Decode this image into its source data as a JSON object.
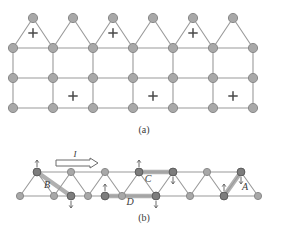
{
  "figure": {
    "type": "triangular-lattice-diagram",
    "background": "#ffffff",
    "panels": [
      {
        "id": "a",
        "caption": "(a)",
        "description": "Two-dimensional triangular lattice with marked plaquettes"
      },
      {
        "id": "b",
        "caption": "(b)",
        "description": "Quasi-one-dimensional triangular ladder with labelled bonds and spin arrows"
      }
    ]
  },
  "colors": {
    "node_fill": "#a8a8a8",
    "node_stroke": "#8a8a8a",
    "node_dark_fill": "#7d7d7d",
    "node_dark_stroke": "#5d5d5d",
    "edge": "#9a9a9a",
    "bond_highlight": "#b0b0b0",
    "marker": "#4a4a4a",
    "label": "#3a3a3a",
    "arrow": "#6a6a6a"
  },
  "panel_a": {
    "caption": "(a)",
    "rows": [
      {
        "name": "row-1",
        "y": 18,
        "x_start": 33,
        "count": 6,
        "spacing": 40
      },
      {
        "name": "row-2",
        "y": 48,
        "x_start": 13,
        "count": 7,
        "spacing": 40
      },
      {
        "name": "row-3",
        "y": 78,
        "x_start": 13,
        "count": 7,
        "spacing": 40
      },
      {
        "name": "row-4",
        "y": 108,
        "x_start": 13,
        "count": 7,
        "spacing": 40
      }
    ],
    "markers": [
      {
        "name": "plus-marker-1",
        "x": 33,
        "y": 33
      },
      {
        "name": "plus-marker-2",
        "x": 113,
        "y": 33
      },
      {
        "name": "plus-marker-3",
        "x": 193,
        "y": 33
      },
      {
        "name": "plus-marker-4",
        "x": 73,
        "y": 96
      },
      {
        "name": "plus-marker-5",
        "x": 153,
        "y": 96
      },
      {
        "name": "plus-marker-6",
        "x": 233,
        "y": 96
      }
    ],
    "marker_symbol": "plus-star"
  },
  "panel_b": {
    "caption": "(b)",
    "current_label": "I",
    "current_arrow": "right-arrow",
    "top_nodes": {
      "y": 172,
      "x_start": 37,
      "count": 7,
      "spacing": 34
    },
    "bottom_nodes": {
      "y": 196,
      "x_start": 20,
      "count": 8,
      "spacing": 34
    },
    "bond_labels": [
      {
        "name": "bond-label-B",
        "text": "B",
        "x": 47,
        "y": 188
      },
      {
        "name": "bond-label-C",
        "text": "C",
        "x": 148,
        "y": 182
      },
      {
        "name": "bond-label-D",
        "text": "D",
        "x": 130,
        "y": 205
      },
      {
        "name": "bond-label-A",
        "text": "A",
        "x": 245,
        "y": 190
      }
    ],
    "spin_arrows": [
      {
        "name": "spin-up-1",
        "x": 37,
        "y": 172,
        "dir": "up"
      },
      {
        "name": "spin-down-1",
        "x": 71,
        "y": 196,
        "dir": "down"
      },
      {
        "name": "spin-up-2",
        "x": 105,
        "y": 196,
        "dir": "up"
      },
      {
        "name": "spin-up-3",
        "x": 139,
        "y": 172,
        "dir": "up"
      },
      {
        "name": "spin-down-2",
        "x": 156,
        "y": 196,
        "dir": "down"
      },
      {
        "name": "spin-down-3",
        "x": 173,
        "y": 172,
        "dir": "down"
      },
      {
        "name": "spin-up-4",
        "x": 224,
        "y": 196,
        "dir": "up"
      },
      {
        "name": "spin-down-4",
        "x": 241,
        "y": 172,
        "dir": "down"
      }
    ],
    "highlighted_bonds": [
      {
        "name": "highlight-bond-B",
        "x1": 37,
        "y1": 172,
        "x2": 71,
        "y2": 196
      },
      {
        "name": "highlight-bond-C",
        "x1": 139,
        "y1": 172,
        "x2": 173,
        "y2": 172
      },
      {
        "name": "highlight-bond-D",
        "x1": 105,
        "y1": 196,
        "x2": 156,
        "y2": 196
      },
      {
        "name": "highlight-bond-A",
        "x1": 224,
        "y1": 196,
        "x2": 241,
        "y2": 172
      }
    ],
    "dark_nodes": [
      {
        "name": "dark-node-1",
        "x": 37,
        "y": 172
      },
      {
        "name": "dark-node-2",
        "x": 71,
        "y": 196
      },
      {
        "name": "dark-node-3",
        "x": 105,
        "y": 196
      },
      {
        "name": "dark-node-4",
        "x": 139,
        "y": 172
      },
      {
        "name": "dark-node-5",
        "x": 156,
        "y": 196
      },
      {
        "name": "dark-node-6",
        "x": 173,
        "y": 172
      },
      {
        "name": "dark-node-7",
        "x": 224,
        "y": 196
      },
      {
        "name": "dark-node-8",
        "x": 241,
        "y": 172
      }
    ]
  }
}
